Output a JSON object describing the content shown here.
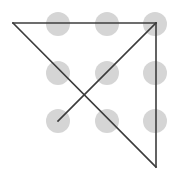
{
  "figure": {
    "canvas": {
      "width": 175,
      "height": 178,
      "background": "#ffffff"
    },
    "dot": {
      "color": "#d5d5d5",
      "radius": 12,
      "count": 9,
      "rows": 3,
      "columns": 3
    },
    "line": {
      "color": "#3c3c3c",
      "width": 1.6,
      "segment_count": 4
    }
  },
  "chart_data": {
    "type": "scatter",
    "xlabel": "",
    "ylabel": "",
    "xlim": [
      0,
      175
    ],
    "ylim": [
      0,
      178
    ],
    "grid": false,
    "legend": "none",
    "dots": [
      {
        "name": "dot-r1-c1",
        "row": 1,
        "col": 1,
        "x": 58,
        "y": 24
      },
      {
        "name": "dot-r1-c2",
        "row": 1,
        "col": 2,
        "x": 107,
        "y": 24
      },
      {
        "name": "dot-r1-c3",
        "row": 1,
        "col": 3,
        "x": 155,
        "y": 24
      },
      {
        "name": "dot-r2-c1",
        "row": 2,
        "col": 1,
        "x": 58,
        "y": 73
      },
      {
        "name": "dot-r2-c2",
        "row": 2,
        "col": 2,
        "x": 107,
        "y": 73
      },
      {
        "name": "dot-r2-c3",
        "row": 2,
        "col": 3,
        "x": 155,
        "y": 73
      },
      {
        "name": "dot-r3-c1",
        "row": 3,
        "col": 1,
        "x": 58,
        "y": 121
      },
      {
        "name": "dot-r3-c2",
        "row": 3,
        "col": 2,
        "x": 107,
        "y": 121
      },
      {
        "name": "dot-r3-c3",
        "row": 3,
        "col": 3,
        "x": 155,
        "y": 121
      }
    ],
    "segments": [
      {
        "name": "segment-top-horizontal",
        "x1": 13,
        "y1": 23,
        "x2": 156,
        "y2": 23
      },
      {
        "name": "segment-main-diagonal",
        "x1": 13,
        "y1": 23,
        "x2": 156,
        "y2": 167
      },
      {
        "name": "segment-right-vertical",
        "x1": 156,
        "y1": 23,
        "x2": 156,
        "y2": 167
      },
      {
        "name": "segment-inner-diagonal",
        "x1": 156,
        "y1": 23,
        "x2": 58,
        "y2": 121
      }
    ],
    "vertices": [
      {
        "name": "vertex-top-left",
        "x": 13,
        "y": 23
      },
      {
        "name": "vertex-top-right",
        "x": 156,
        "y": 23
      },
      {
        "name": "vertex-bottom-right",
        "x": 156,
        "y": 167
      },
      {
        "name": "vertex-inner-end",
        "x": 58,
        "y": 121
      }
    ],
    "intersection": {
      "name": "crossing-point",
      "x": 90,
      "y": 93
    }
  }
}
